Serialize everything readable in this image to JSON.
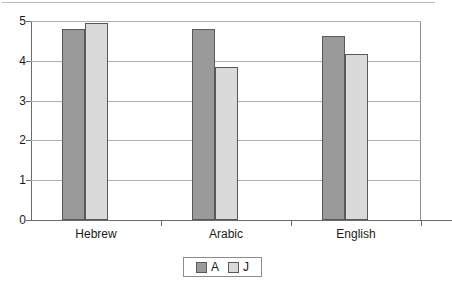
{
  "chart_data": {
    "type": "bar",
    "title": "",
    "subtitle": "",
    "xlabel": "",
    "ylabel": "",
    "categories": [
      "Hebrew",
      "Arabic",
      "English"
    ],
    "series": [
      {
        "name": "A",
        "color": "#9a9a9a",
        "values": [
          4.8,
          4.8,
          4.62
        ]
      },
      {
        "name": "J",
        "color": "#dadada",
        "values": [
          4.94,
          3.85,
          4.17
        ]
      }
    ],
    "ylim": [
      0,
      5
    ],
    "yticks": [
      0,
      1,
      2,
      3,
      4,
      5
    ],
    "ytick_labels": [
      "0",
      "1",
      "2",
      "3",
      "4",
      "5"
    ],
    "grid": true,
    "grid_axis": "y",
    "legend_position": "bottom",
    "legend_entries": [
      "A",
      "J"
    ]
  },
  "axes": {
    "y_labels": [
      "5",
      "4",
      "3",
      "2",
      "1",
      "0"
    ],
    "x_labels": [
      "Hebrew",
      "Arabic",
      "English"
    ]
  },
  "legend": {
    "items": [
      {
        "label": "A",
        "swatch": "dark-gray-swatch"
      },
      {
        "label": "J",
        "swatch": "light-gray-swatch"
      }
    ]
  },
  "colors": {
    "series_a": "#9a9a9a",
    "series_j": "#dadada",
    "bar_border": "#595959",
    "gridline": "#b0b0b0",
    "axis": "#6b6b6b",
    "text": "#1a1a1a",
    "background": "#ffffff"
  }
}
